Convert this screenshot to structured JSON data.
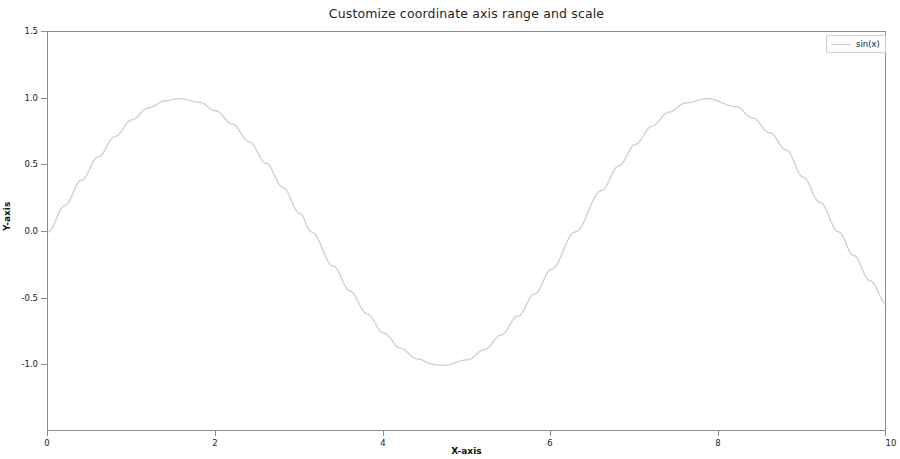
{
  "chart_data": {
    "type": "line",
    "title": "Customize coordinate axis range and scale",
    "xlabel": "X-axis",
    "ylabel": "Y-axis",
    "xlim": [
      0,
      10
    ],
    "ylim": [
      -1.5,
      1.5
    ],
    "grid": false,
    "legend_position": "upper right",
    "xticks": [
      0,
      2,
      4,
      6,
      8,
      10
    ],
    "xtick_labels": [
      "0",
      "2",
      "4",
      "6",
      "8",
      "10"
    ],
    "yticks": [
      1.5,
      1.0,
      0.5,
      0.0,
      -0.5,
      -1.0
    ],
    "ytick_labels": [
      "1.5",
      "1.0",
      "0.5",
      "0.0",
      "-0.5",
      "-1.0"
    ],
    "series": [
      {
        "name": "sin(x)",
        "color": "#cdced1",
        "linewidth": 1.3,
        "x": [
          0.0,
          0.2,
          0.4,
          0.6,
          0.8,
          1.0,
          1.2,
          1.4,
          1.5708,
          1.8,
          2.0,
          2.2,
          2.4,
          2.6,
          2.8,
          3.0,
          3.1416,
          3.4,
          3.6,
          3.8,
          4.0,
          4.2,
          4.4,
          4.6,
          4.7124,
          5.0,
          5.2,
          5.4,
          5.6,
          5.8,
          6.0,
          6.2832,
          6.6,
          6.8,
          7.0,
          7.2,
          7.4,
          7.6,
          7.854,
          8.2,
          8.4,
          8.6,
          8.8,
          9.0,
          9.2,
          9.4248,
          9.6,
          9.8,
          10.0
        ],
        "y": [
          0.0,
          0.1987,
          0.3894,
          0.5646,
          0.7174,
          0.8415,
          0.932,
          0.9854,
          1.0,
          0.9738,
          0.9093,
          0.8085,
          0.6755,
          0.5155,
          0.335,
          0.1411,
          0.0,
          -0.2555,
          -0.4425,
          -0.6119,
          -0.7568,
          -0.8716,
          -0.9516,
          -0.9937,
          -1.0,
          -0.9589,
          -0.8835,
          -0.7728,
          -0.6313,
          -0.4646,
          -0.2794,
          0.0,
          0.3115,
          0.4941,
          0.657,
          0.7937,
          0.8987,
          0.9679,
          1.0,
          0.9407,
          0.8546,
          0.7451,
          0.6149,
          0.4121,
          0.2229,
          0.0,
          -0.1743,
          -0.3665,
          -0.544
        ]
      }
    ]
  },
  "figure": {
    "title": "Customize coordinate axis range and scale",
    "xlabel": "X-axis",
    "ylabel": "Y-axis"
  },
  "legend": {
    "entries": [
      {
        "label": "sin(x)",
        "color": "#cdced1"
      }
    ]
  },
  "colors": {
    "background": "#ffffff",
    "axis": "#8c8c8c",
    "text": "#1a1a1a",
    "line": "#cdced1"
  }
}
